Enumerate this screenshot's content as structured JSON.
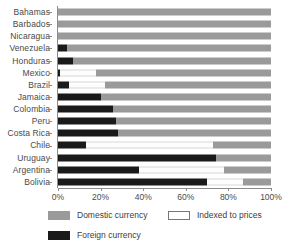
{
  "chart_data": {
    "type": "bar",
    "orientation": "horizontal",
    "stacked": true,
    "title": "",
    "subtitle": "",
    "xlabel": "",
    "ylabel": "",
    "xlim": [
      0,
      100
    ],
    "xticks": [
      0,
      20,
      40,
      60,
      80,
      100
    ],
    "xticklabels": [
      "0%",
      "20%",
      "40%",
      "60%",
      "80%",
      "100%"
    ],
    "grid": true,
    "grid_axis": "x",
    "legend_position": "bottom",
    "categories": [
      "Bahamas",
      "Barbados",
      "Nicaragua",
      "Venezuela",
      "Honduras",
      "Mexico",
      "Brazil",
      "Jamaica",
      "Colombia",
      "Peru",
      "Costa Rica",
      "Chile",
      "Uruguay",
      "Argentina",
      "Bolivia"
    ],
    "series": [
      {
        "name": "Foreign currency",
        "color": "#1a1a1a",
        "values": [
          0,
          0,
          0,
          4,
          7,
          1,
          5,
          20,
          26,
          27,
          28,
          13,
          74,
          38,
          70
        ]
      },
      {
        "name": "Indexed to prices",
        "color": "#ffffff",
        "values": [
          0,
          0,
          0,
          0,
          0,
          17,
          17,
          0,
          0,
          0,
          0,
          60,
          0,
          40,
          17
        ]
      },
      {
        "name": "Domestic currency",
        "color": "#9a9a9a",
        "values": [
          100,
          100,
          100,
          96,
          93,
          82,
          78,
          80,
          74,
          73,
          72,
          27,
          26,
          22,
          13
        ]
      }
    ]
  },
  "legend": {
    "items": [
      {
        "label": "Domestic currency",
        "swatch": "domestic"
      },
      {
        "label": "Indexed to prices",
        "swatch": "indexed"
      },
      {
        "label": "Foreign currency",
        "swatch": "foreign"
      }
    ]
  }
}
